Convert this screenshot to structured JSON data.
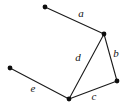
{
  "figure": {
    "type": "geometry-diagram",
    "background_color": "#ffffff",
    "stroke_color": "#1a1a1a",
    "label_color": "#141414",
    "width": 127,
    "height": 108,
    "vertices": [
      {
        "id": "P1",
        "name": "vertex-top-left",
        "x": 45,
        "y": 7
      },
      {
        "id": "P2",
        "name": "vertex-apex",
        "x": 104,
        "y": 34
      },
      {
        "id": "P3",
        "name": "vertex-right",
        "x": 117,
        "y": 81
      },
      {
        "id": "P4",
        "name": "vertex-bottom",
        "x": 69,
        "y": 99
      },
      {
        "id": "P5",
        "name": "vertex-left",
        "x": 10,
        "y": 68
      }
    ],
    "edges": [
      {
        "id": "a",
        "label": "a",
        "from": "P1",
        "to": "P2",
        "x1": 45,
        "y1": 7,
        "x2": 104,
        "y2": 34,
        "label_x": 81,
        "label_y": 14
      },
      {
        "id": "b",
        "label": "b",
        "from": "P2",
        "to": "P3",
        "x1": 104,
        "y1": 34,
        "x2": 117,
        "y2": 81,
        "label_x": 116,
        "label_y": 54
      },
      {
        "id": "c",
        "label": "c",
        "from": "P3",
        "to": "P4",
        "x1": 117,
        "y1": 81,
        "x2": 69,
        "y2": 99,
        "label_x": 94,
        "label_y": 97
      },
      {
        "id": "d",
        "label": "d",
        "from": "P2",
        "to": "P4",
        "x1": 104,
        "y1": 34,
        "x2": 69,
        "y2": 99,
        "label_x": 78,
        "label_y": 58
      },
      {
        "id": "e",
        "label": "e",
        "from": "P5",
        "to": "P4",
        "x1": 10,
        "y1": 68,
        "x2": 69,
        "y2": 99,
        "label_x": 33,
        "label_y": 89
      }
    ],
    "vertex_radius": 2.4
  }
}
